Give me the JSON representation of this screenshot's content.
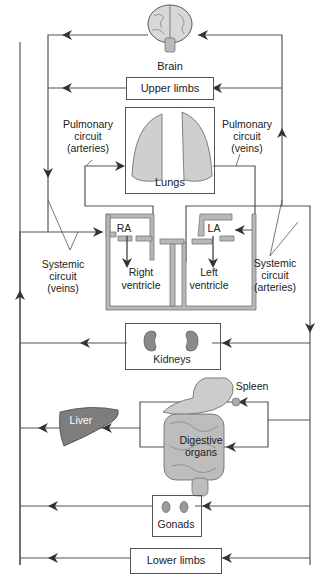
{
  "organs": {
    "brain": "Brain",
    "upper_limbs": "Upper limbs",
    "lungs": "Lungs",
    "kidneys": "Kidneys",
    "spleen": "Spleen",
    "liver": "Liver",
    "digestive_organs_line1": "Digestive",
    "digestive_organs_line2": "organs",
    "gonads": "Gonads",
    "lower_limbs": "Lower limbs"
  },
  "heart": {
    "ra": "RA",
    "la": "LA",
    "right_ventricle_line1": "Right",
    "right_ventricle_line2": "ventricle",
    "left_ventricle_line1": "Left",
    "left_ventricle_line2": "ventricle"
  },
  "circuits": {
    "pulmonary_arteries": [
      "Pulmonary",
      "circuit",
      "(arteries)"
    ],
    "pulmonary_veins": [
      "Pulmonary",
      "circuit",
      "(veins)"
    ],
    "systemic_veins": [
      "Systemic",
      "circuit",
      "(veins)"
    ],
    "systemic_arteries": [
      "Systemic",
      "circuit",
      "(arteries)"
    ]
  },
  "colors": {
    "line": "#444444",
    "heart_wall": "#b8b8b8",
    "organ_gray": "#9a9a9a",
    "liver": "#7d7d7d"
  }
}
